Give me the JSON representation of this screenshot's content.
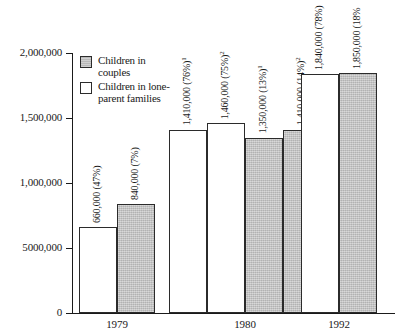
{
  "chart_data": {
    "type": "bar",
    "title": "",
    "xlabel": "",
    "ylabel": "",
    "categories": [
      "1979",
      "1980",
      "1992"
    ],
    "ylim": [
      0,
      2000000
    ],
    "grid": false,
    "legend_position": "top-left",
    "y_ticks": [
      {
        "value": 2000000,
        "label": "2,000,000"
      },
      {
        "value": 1500000,
        "label": "1,500,000"
      },
      {
        "value": 1000000,
        "label": "1,000,000"
      },
      {
        "value": 500000,
        "label": "5000,000"
      },
      {
        "value": 0,
        "label": "0"
      }
    ],
    "series": [
      {
        "name": "Children in lone-parent families",
        "color": "#ffffff"
      },
      {
        "name": "Children in couples",
        "color": "#c3c3c3"
      }
    ],
    "bars": [
      {
        "group": "1979",
        "series": "Children in lone-parent families",
        "value": 660000,
        "label": "660,000 (47%)",
        "note": ""
      },
      {
        "group": "1979",
        "series": "Children in couples",
        "value": 840000,
        "label": "840,000 (7%)",
        "note": ""
      },
      {
        "group": "1980",
        "series": "Children in lone-parent families",
        "value": 1410000,
        "label": "1,410,000 (76%)",
        "note": "1"
      },
      {
        "group": "1980",
        "series": "Children in lone-parent families",
        "value": 1460000,
        "label": "1,460,000 (75%)",
        "note": "2"
      },
      {
        "group": "1980",
        "series": "Children in couples",
        "value": 1350000,
        "label": "1,350,000 (13%)",
        "note": "1"
      },
      {
        "group": "1980",
        "series": "Children in couples",
        "value": 1410000,
        "label": "1,410,000 (14%)",
        "note": "2"
      },
      {
        "group": "1992",
        "series": "Children in lone-parent families",
        "value": 1840000,
        "label": "1,840,000 (78%)",
        "note": ""
      },
      {
        "group": "1992",
        "series": "Children in couples",
        "value": 1850000,
        "label": "1,850,000 (18%",
        "note": ""
      }
    ]
  },
  "legend": {
    "items": [
      {
        "label": "Children in couples",
        "swatch": "couples"
      },
      {
        "label": "Children in lone-parent families",
        "swatch": "lone"
      }
    ]
  },
  "colors": {
    "couples_fill": "#c3c3c3",
    "lone_fill": "#ffffff",
    "axis": "#1a1a1a",
    "background": "#ffffff"
  }
}
